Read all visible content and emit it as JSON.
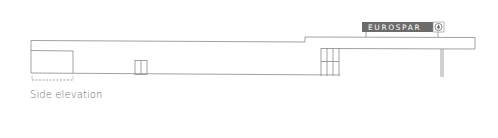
{
  "caption": "Side elevation",
  "sign": {
    "text": "EUROSPAR",
    "background": "#6b6b6b",
    "text_color": "#ffffff",
    "logo_icon": "spar-tree-logo"
  },
  "colors": {
    "line": "#8a8a8a",
    "background": "#ffffff"
  }
}
